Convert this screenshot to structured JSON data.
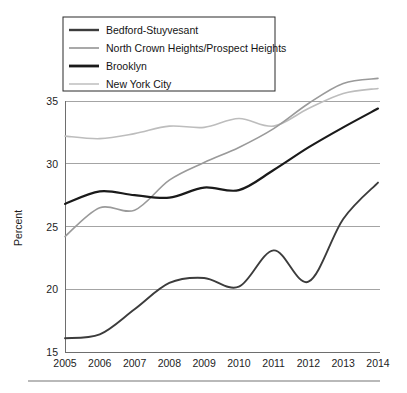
{
  "chart_data": {
    "type": "line",
    "title": "",
    "xlabel": "",
    "ylabel": "Percent",
    "x": [
      2005,
      2006,
      2007,
      2008,
      2009,
      2010,
      2011,
      2012,
      2013,
      2014
    ],
    "xtick_labels": [
      "2005",
      "2006",
      "2007",
      "2008",
      "2009",
      "2010",
      "2011",
      "2012",
      "2013",
      "2014"
    ],
    "ytick_labels": [
      "15",
      "20",
      "25",
      "30",
      "35"
    ],
    "yticks": [
      15,
      20,
      25,
      30,
      35
    ],
    "ylim": [
      15,
      37.8
    ],
    "xlim": [
      2005,
      2014
    ],
    "grid": true,
    "grid_axis": "y",
    "legend_position": "top-left",
    "series": [
      {
        "name": "Bedford-Stuyvesant",
        "color": "#3c3c3c",
        "width": 1.9,
        "values": [
          16.1,
          16.4,
          18.4,
          20.5,
          20.9,
          20.2,
          23.1,
          20.6,
          25.6,
          28.5
        ]
      },
      {
        "name": "North Crown Heights/Prospect Heights",
        "color": "#9a9a9a",
        "width": 1.6,
        "values": [
          24.2,
          26.5,
          26.3,
          28.7,
          30.1,
          31.3,
          32.8,
          34.8,
          36.4,
          36.8
        ]
      },
      {
        "name": "Brooklyn",
        "color": "#1a1a1a",
        "width": 2.2,
        "values": [
          26.8,
          27.8,
          27.5,
          27.3,
          28.1,
          27.9,
          29.5,
          31.3,
          32.9,
          34.4
        ]
      },
      {
        "name": "New York City",
        "color": "#bdbdbd",
        "width": 1.6,
        "values": [
          32.2,
          32.0,
          32.4,
          33.0,
          32.9,
          33.6,
          33.0,
          34.4,
          35.6,
          36.0
        ]
      }
    ]
  },
  "legend": {
    "entries": [
      {
        "label": "Bedford-Stuyvesant",
        "swatch_color": "#3c3c3c",
        "swatch_width": 2.4
      },
      {
        "label": "North Crown Heights/Prospect Heights",
        "swatch_color": "#9a9a9a",
        "swatch_width": 1.7
      },
      {
        "label": "Brooklyn",
        "swatch_color": "#1a1a1a",
        "swatch_width": 2.8
      },
      {
        "label": "New York City",
        "swatch_color": "#c6c6c6",
        "swatch_width": 1.7
      }
    ]
  },
  "axes": {
    "y_title": "Percent"
  }
}
